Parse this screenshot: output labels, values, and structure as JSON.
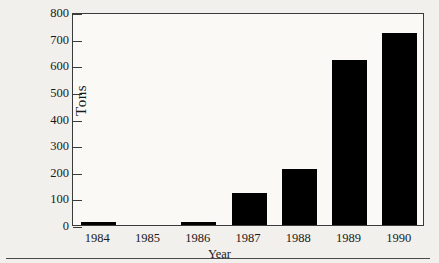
{
  "figure": {
    "background_color": "#f2f0ec",
    "plot_background_color": "#faf9f6",
    "frame_color": "#3a3a3a",
    "bar_color": "#000000"
  },
  "axes": {
    "y_title": "Tons",
    "x_title": "Year",
    "y_ticks": [
      "0",
      "100",
      "200",
      "300",
      "400",
      "500",
      "600",
      "700",
      "800"
    ],
    "x_ticks": [
      "1984",
      "1985",
      "1986",
      "1987",
      "1988",
      "1989",
      "1990"
    ]
  },
  "chart_data": {
    "type": "bar",
    "title": "",
    "subtitle": "",
    "xlabel": "Year",
    "ylabel": "Tons",
    "categories": [
      "1984",
      "1985",
      "1986",
      "1987",
      "1988",
      "1989",
      "1990"
    ],
    "values": [
      10,
      0,
      12,
      120,
      210,
      620,
      720
    ],
    "ylim": [
      0,
      800
    ],
    "ytick_interval": 100,
    "grid": false,
    "legend": false,
    "bar_color": "#000000",
    "annotations": []
  }
}
